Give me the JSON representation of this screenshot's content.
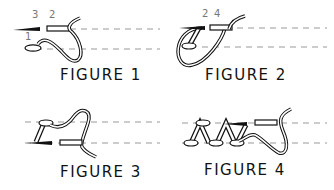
{
  "figures": [
    {
      "caption": "FIGURE 1",
      "labels": [
        "3",
        "2",
        "1"
      ]
    },
    {
      "caption": "FIGURE 2",
      "labels": [
        "2",
        "4"
      ]
    },
    {
      "caption": "FIGURE 3",
      "labels": []
    },
    {
      "caption": "FIGURE 4",
      "labels": []
    }
  ],
  "colors": {
    "line": "#111111",
    "dash": "#999999",
    "label": "#777777"
  }
}
